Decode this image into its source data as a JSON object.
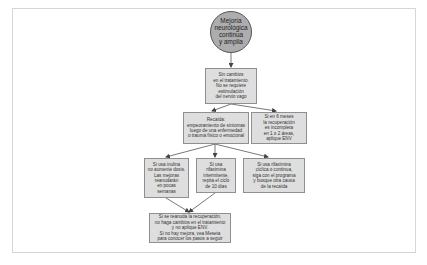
{
  "diagram": {
    "type": "flowchart",
    "colors": {
      "start_fill": "#adadad",
      "start_border": "#555555",
      "box_fill": "#dedede",
      "box_border": "#8f8f8f",
      "line": "#555555",
      "frame_border": "#d6d6d6"
    },
    "nodes": {
      "start": "Mejoría\nneurológica\ncontinua\ny amplia",
      "no_change": "Sin cambios\nen el tratamiento.\nNo se requiere\nestimulación\ndel nervio vago",
      "relapse": "Recaída:\nempeoramiento de síntomas\nluego de una enfermedad\no trauma físico o emocional",
      "six_months": "Si en 6 meses\nla recuperación\nes incompleta\nen 1 o 2 áreas,\naplique ENV",
      "inulina": "Si usa inulina\nno aumente dosis.\nLas mejoras\nreanudarán\nen pocas\nsemanas",
      "intermittent": "Si usa\nrifaximina\nintermitente,\nrepita el ciclo\nde 10 días",
      "cyclic": "Si usa rifaximina\ncíclica o continua,\nsiga con el programa\ny busque otra causa\nde la recaída",
      "final": "Si se reanuda la recuperación,\nno haga cambios en el tratamiento\ny no aplique ENV.\nSi no hay mejora, vea Meseta\npara conocer los pasos a seguir"
    },
    "edges": [
      {
        "from": "start",
        "to": "no_change"
      },
      {
        "from": "no_change",
        "to": "relapse"
      },
      {
        "from": "no_change",
        "to": "six_months"
      },
      {
        "from": "relapse",
        "to": "inulina"
      },
      {
        "from": "relapse",
        "to": "intermittent"
      },
      {
        "from": "relapse",
        "to": "cyclic"
      },
      {
        "from": "inulina",
        "to": "final"
      },
      {
        "from": "intermittent",
        "to": "final"
      }
    ]
  }
}
